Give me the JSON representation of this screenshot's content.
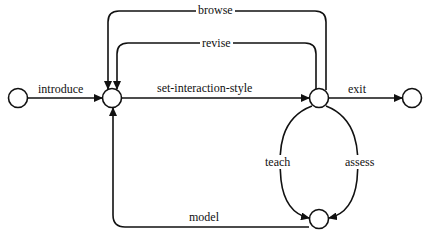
{
  "diagram": {
    "type": "state-transition",
    "colors": {
      "stroke": "#111111",
      "background": "#ffffff"
    },
    "nodes": [
      {
        "id": "start",
        "name": "start-state"
      },
      {
        "id": "hub",
        "name": "interaction-hub-state"
      },
      {
        "id": "style",
        "name": "interaction-style-state"
      },
      {
        "id": "end",
        "name": "exit-state"
      },
      {
        "id": "tutor",
        "name": "teach-assess-state"
      }
    ],
    "edges": [
      {
        "from": "start",
        "to": "hub",
        "label": "introduce"
      },
      {
        "from": "hub",
        "to": "style",
        "label": "set-interaction-style"
      },
      {
        "from": "style",
        "to": "end",
        "label": "exit"
      },
      {
        "from": "style",
        "to": "hub",
        "label": "browse"
      },
      {
        "from": "style",
        "to": "hub",
        "label": "revise"
      },
      {
        "from": "style",
        "to": "tutor",
        "label": "teach"
      },
      {
        "from": "style",
        "to": "tutor",
        "label": "assess"
      },
      {
        "from": "tutor",
        "to": "hub",
        "label": "model"
      }
    ]
  }
}
